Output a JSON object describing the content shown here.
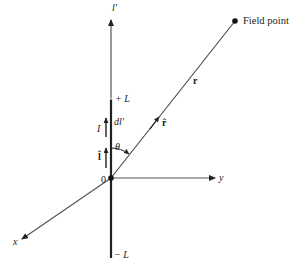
{
  "diagram": {
    "colors": {
      "ink": "#222222",
      "axis": "#555555",
      "background": "#ffffff"
    },
    "labels": {
      "l_prime_axis": "l'",
      "plus_L": "+ L",
      "minus_L": "− L",
      "current": "I",
      "dl_prime": "dl'",
      "l_hat": "l̂",
      "theta": "θ",
      "origin": "0",
      "y_axis": "y",
      "x_axis": "x",
      "r_vector": "r",
      "r_hat": "r̂",
      "field_point": "Field point"
    }
  }
}
